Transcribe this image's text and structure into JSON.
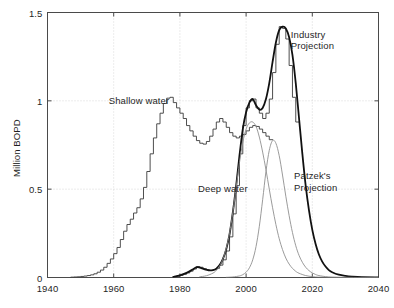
{
  "chart_data": {
    "type": "line",
    "title": "",
    "xlabel": "",
    "ylabel": "Million BOPD",
    "xlim": [
      1940,
      2040
    ],
    "ylim": [
      0,
      1.5
    ],
    "xticks": [
      1940,
      1960,
      1980,
      2000,
      2020,
      2040
    ],
    "xtick_labels": [
      "1940",
      "1960",
      "1980",
      "2000",
      "2020",
      "2040"
    ],
    "yticks": [
      0,
      0.5,
      1,
      1.5
    ],
    "ytick_labels": [
      "0",
      "0.5",
      "1",
      "1.5"
    ],
    "grid": true,
    "grid_style": "dotted",
    "legend": "none",
    "annotations": [
      {
        "text": "Shallow water",
        "x": 1965,
        "y": 1.02,
        "name": "annotation-shallow-water"
      },
      {
        "text": "Deep water",
        "x": 1989,
        "y": 0.49,
        "name": "annotation-deep-water"
      },
      {
        "text": "Industry\nProjection",
        "x": 2015,
        "y": 1.32,
        "name": "annotation-industry-projection"
      },
      {
        "text": "Patzek's\nProjection",
        "x": 2017,
        "y": 0.54,
        "name": "annotation-patzeks-projection"
      }
    ],
    "series": [
      {
        "name": "Shallow water production (histogram)",
        "style": "step",
        "color": "#3a3a3a",
        "width": 0.9,
        "x": [
          1947,
          1948,
          1949,
          1950,
          1951,
          1952,
          1953,
          1954,
          1955,
          1956,
          1957,
          1958,
          1959,
          1960,
          1961,
          1962,
          1963,
          1964,
          1965,
          1966,
          1967,
          1968,
          1969,
          1970,
          1971,
          1972,
          1973,
          1974,
          1975,
          1976,
          1977,
          1978,
          1979,
          1980,
          1981,
          1982,
          1983,
          1984,
          1985,
          1986,
          1987,
          1988,
          1989,
          1990,
          1991,
          1992,
          1993,
          1994,
          1995,
          1996,
          1997,
          1998,
          1999,
          2000,
          2001,
          2002,
          2003,
          2004,
          2005,
          2006,
          2007
        ],
        "y": [
          0.002,
          0.003,
          0.004,
          0.006,
          0.008,
          0.011,
          0.015,
          0.021,
          0.03,
          0.042,
          0.058,
          0.08,
          0.105,
          0.135,
          0.17,
          0.215,
          0.262,
          0.3,
          0.33,
          0.365,
          0.395,
          0.445,
          0.51,
          0.6,
          0.7,
          0.79,
          0.87,
          0.93,
          0.985,
          1.015,
          1.02,
          0.99,
          0.96,
          0.93,
          0.9,
          0.86,
          0.83,
          0.8,
          0.775,
          0.76,
          0.755,
          0.77,
          0.8,
          0.84,
          0.88,
          0.9,
          0.88,
          0.85,
          0.82,
          0.8,
          0.79,
          0.8,
          0.81,
          0.83,
          0.85,
          0.86,
          0.855,
          0.84,
          0.82,
          0.8,
          0.78
        ]
      },
      {
        "name": "Deep water production (histogram)",
        "style": "step",
        "color": "#3a3a3a",
        "width": 0.9,
        "x": [
          1978,
          1979,
          1980,
          1981,
          1982,
          1983,
          1984,
          1985,
          1986,
          1987,
          1988,
          1989,
          1990,
          1991,
          1992,
          1993,
          1994,
          1995,
          1996,
          1997,
          1998,
          1999,
          2000,
          2001,
          2002,
          2003,
          2004,
          2005,
          2006,
          2007,
          2008,
          2009,
          2010,
          2011,
          2012,
          2013,
          2014,
          2015
        ],
        "y": [
          0.004,
          0.007,
          0.012,
          0.018,
          0.026,
          0.036,
          0.048,
          0.062,
          0.058,
          0.05,
          0.043,
          0.04,
          0.044,
          0.052,
          0.07,
          0.1,
          0.15,
          0.23,
          0.36,
          0.52,
          0.7,
          0.86,
          0.96,
          1.0,
          1.01,
          0.96,
          0.93,
          0.9,
          0.93,
          1.01,
          1.16,
          1.32,
          1.42,
          1.41,
          1.35,
          1.2,
          1.02,
          0.88
        ]
      },
      {
        "name": "Industry Projection (heavy smooth curve)",
        "style": "smooth",
        "color": "#111111",
        "width": 1.8,
        "x": [
          1978,
          1980,
          1982,
          1984,
          1985,
          1986,
          1987,
          1988,
          1989,
          1990,
          1991,
          1992,
          1993,
          1994,
          1995,
          1996,
          1997,
          1998,
          1999,
          2000,
          2001,
          2002,
          2003,
          2004,
          2005,
          2006,
          2007,
          2008,
          2009,
          2010,
          2011,
          2012,
          2013,
          2014,
          2015,
          2016,
          2017,
          2018,
          2019,
          2020,
          2021,
          2022,
          2023,
          2024,
          2025,
          2026,
          2028,
          2030,
          2032,
          2035,
          2040
        ],
        "y": [
          0.004,
          0.012,
          0.026,
          0.047,
          0.058,
          0.056,
          0.05,
          0.044,
          0.04,
          0.042,
          0.05,
          0.07,
          0.105,
          0.16,
          0.245,
          0.37,
          0.52,
          0.69,
          0.84,
          0.935,
          0.99,
          1.01,
          0.975,
          0.95,
          0.96,
          1.01,
          1.1,
          1.22,
          1.33,
          1.4,
          1.42,
          1.41,
          1.36,
          1.26,
          1.1,
          0.9,
          0.7,
          0.52,
          0.38,
          0.27,
          0.19,
          0.13,
          0.09,
          0.062,
          0.042,
          0.03,
          0.016,
          0.009,
          0.005,
          0.002,
          0.001
        ]
      },
      {
        "name": "Deep water fit (thin grey curve)",
        "style": "smooth",
        "color": "#8f8f8f",
        "width": 0.9,
        "x": [
          1986,
          1988,
          1990,
          1991,
          1992,
          1993,
          1994,
          1995,
          1996,
          1997,
          1998,
          1999,
          2000,
          2001,
          2002,
          2003,
          2004,
          2005,
          2006,
          2007,
          2008,
          2009,
          2010,
          2011,
          2012,
          2013,
          2014,
          2015,
          2016,
          2018,
          2020,
          2022,
          2025,
          2030,
          2040
        ],
        "y": [
          0.004,
          0.01,
          0.025,
          0.04,
          0.065,
          0.105,
          0.165,
          0.25,
          0.37,
          0.51,
          0.65,
          0.765,
          0.84,
          0.875,
          0.88,
          0.855,
          0.795,
          0.71,
          0.61,
          0.5,
          0.395,
          0.3,
          0.22,
          0.158,
          0.11,
          0.076,
          0.052,
          0.035,
          0.024,
          0.011,
          0.005,
          0.002,
          0.001,
          0.0,
          0.0
        ]
      },
      {
        "name": "Patzek's Projection (thin grey curve)",
        "style": "smooth",
        "color": "#8f8f8f",
        "width": 0.9,
        "x": [
          1994,
          1996,
          1998,
          1999,
          2000,
          2001,
          2002,
          2003,
          2004,
          2005,
          2006,
          2007,
          2008,
          2009,
          2010,
          2011,
          2012,
          2013,
          2014,
          2015,
          2016,
          2017,
          2018,
          2019,
          2020,
          2021,
          2022,
          2024,
          2026,
          2030,
          2035,
          2040
        ],
        "y": [
          0.001,
          0.003,
          0.009,
          0.016,
          0.03,
          0.055,
          0.1,
          0.175,
          0.29,
          0.44,
          0.6,
          0.72,
          0.775,
          0.76,
          0.69,
          0.58,
          0.46,
          0.35,
          0.255,
          0.18,
          0.125,
          0.086,
          0.058,
          0.039,
          0.026,
          0.017,
          0.011,
          0.005,
          0.002,
          0.001,
          0.0,
          0.0
        ]
      }
    ]
  },
  "axes": {
    "ylabel": "Million BOPD",
    "xtick_labels": [
      "1940",
      "1960",
      "1980",
      "2000",
      "2020",
      "2040"
    ],
    "ytick_labels": [
      "0",
      "0.5",
      "1",
      "1.5"
    ]
  },
  "annotations": {
    "shallow_water": "Shallow water",
    "deep_water": "Deep water",
    "industry_projection_line1": "Industry",
    "industry_projection_line2": "Projection",
    "patzeks_projection_line1": "Patzek's",
    "patzeks_projection_line2": "Projection"
  },
  "colors": {
    "background": "#ffffff",
    "axis": "#4a4a4a",
    "grid": "#bfbfbf",
    "histogram": "#3a3a3a",
    "heavy_curve": "#111111",
    "thin_curve": "#8f8f8f",
    "text": "#1f1f1f"
  }
}
